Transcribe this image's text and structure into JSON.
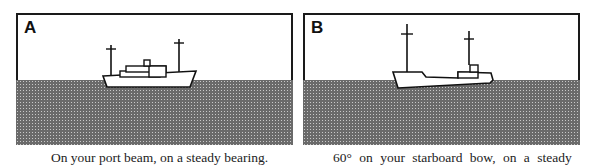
{
  "panels": [
    {
      "label": "A",
      "caption": "On your port beam, on a steady bearing."
    },
    {
      "label": "B",
      "caption": "60° on your starboard bow, on a steady"
    }
  ],
  "colors": {
    "frame": "#1a1a1a",
    "water": "#6a6a6a",
    "sky": "#ffffff"
  }
}
